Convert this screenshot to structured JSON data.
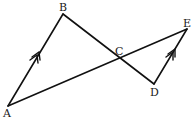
{
  "diagram": {
    "type": "geometry",
    "points": {
      "A": {
        "label": "A",
        "x": 8,
        "y": 106
      },
      "B": {
        "label": "B",
        "x": 63,
        "y": 14
      },
      "C": {
        "label": "C",
        "x": 119,
        "y": 58
      },
      "D": {
        "label": "D",
        "x": 154,
        "y": 84
      },
      "E": {
        "label": "E",
        "x": 187,
        "y": 29
      }
    },
    "segments": [
      "AB",
      "BD",
      "AE",
      "DE"
    ],
    "parallel_markers": [
      "AB",
      "DE"
    ],
    "labels": {
      "A": "A",
      "B": "B",
      "C": "C",
      "D": "D",
      "E": "E"
    }
  }
}
